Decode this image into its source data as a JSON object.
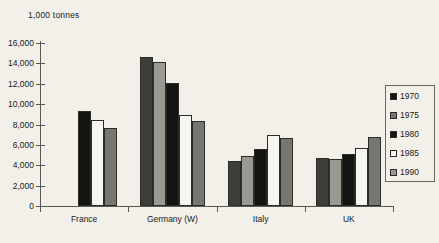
{
  "chart_data": {
    "type": "bar",
    "title": "",
    "unit_label": "1,000 tonnes",
    "xlabel": "",
    "ylabel": "1,000 tonnes",
    "ylim": [
      0,
      16000
    ],
    "yticks": [
      0,
      2000,
      4000,
      6000,
      8000,
      10000,
      12000,
      14000,
      16000
    ],
    "ytick_labels": [
      "0",
      "2,000",
      "4,000",
      "6,000",
      "8,000",
      "10,000",
      "12,000",
      "14,000",
      "16,000"
    ],
    "grid": false,
    "legend_position": "right",
    "categories": [
      "France",
      "Germany (W)",
      "Italy",
      "UK"
    ],
    "series": [
      {
        "name": "1970",
        "color": "#3d3d3a",
        "values": [
          null,
          14650,
          4400,
          4700
        ]
      },
      {
        "name": "1975",
        "color": "#9a9a93",
        "values": [
          null,
          14100,
          4900,
          4650
        ]
      },
      {
        "name": "1980",
        "color": "#141412",
        "values": [
          9350,
          12100,
          5600,
          5150
        ]
      },
      {
        "name": "1985",
        "color": "#f7f5ef",
        "values": [
          8450,
          8950,
          7000,
          5700
        ]
      },
      {
        "name": "1990",
        "color": "#77776f",
        "values": [
          7650,
          8300,
          6700,
          6800
        ]
      }
    ]
  },
  "legend": {
    "items": [
      {
        "label": "1970",
        "color": "#141412"
      },
      {
        "label": "1975",
        "color": "#77776f"
      },
      {
        "label": "1980",
        "color": "#141412"
      },
      {
        "label": "1985",
        "color": "#f7f5ef"
      },
      {
        "label": "1990",
        "color": "#9a9a93"
      }
    ]
  },
  "colors": {
    "background": "#f2f0e9",
    "axis": "#5a5a52",
    "text": "#1a1a1a",
    "bar_outline": "#2b2b28"
  }
}
